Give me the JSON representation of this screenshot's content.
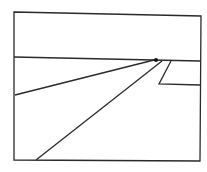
{
  "diagram": {
    "type": "perspective-sketch",
    "stroke_color": "#2a2a2a",
    "background": "#ffffff",
    "frame": {
      "points": "14,12 201,16 200,161 14,160"
    },
    "horizon": {
      "x1": 14,
      "y1": 57,
      "x2": 200,
      "y2": 61
    },
    "vanishing_point": {
      "cx": 156,
      "cy": 60,
      "r": 2
    },
    "road_left_edge": {
      "x1": 15,
      "y1": 95,
      "x2": 154,
      "y2": 60
    },
    "road_right_edge": {
      "x1": 36,
      "y1": 160,
      "x2": 162,
      "y2": 61
    },
    "side_shape": {
      "points": "171,61 159,84 200,85"
    }
  }
}
